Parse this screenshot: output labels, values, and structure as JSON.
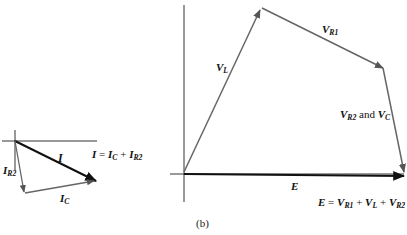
{
  "left_diagram": {
    "phasors": [
      {
        "name": "I",
        "label": "I",
        "sub": ""
      },
      {
        "name": "IR2",
        "label": "I",
        "sub": "R2"
      },
      {
        "name": "IC",
        "label": "I",
        "sub": "C"
      }
    ],
    "equation": {
      "lhs": "I",
      "eq": " = ",
      "t1": "I",
      "t1sub": "C",
      "plus": " + ",
      "t2": "I",
      "t2sub": "R2"
    }
  },
  "right_diagram": {
    "phasors": [
      {
        "name": "VL",
        "label": "V",
        "sub": "L"
      },
      {
        "name": "VR1",
        "label": "V",
        "sub": "R1"
      },
      {
        "name": "VR2_VC",
        "label_a": "V",
        "sub_a": "R2",
        "and": " and ",
        "label_b": "V",
        "sub_b": "C"
      },
      {
        "name": "E",
        "label": "E",
        "sub": ""
      }
    ],
    "equation": {
      "lhs": "E",
      "eq": " = ",
      "t1": "V",
      "t1sub": "R1",
      "p1": " + ",
      "t2": "V",
      "t2sub": "L",
      "p2": " + ",
      "t3": "V",
      "t3sub": "R2"
    }
  },
  "caption": "(b)",
  "colors": {
    "dark": "#111111",
    "gray": "#666666"
  }
}
